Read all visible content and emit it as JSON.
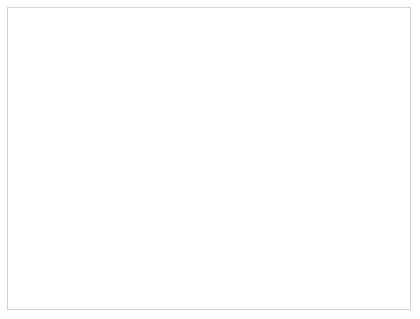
{
  "chart_data": {
    "type": "line",
    "title": "",
    "xlabel": "year",
    "ylabel": "annual discovery smoothed on 5 years & production Tcf/a",
    "ylabel_line1": "annual discovery smoothed on",
    "ylabel_line2": "5 years & production Tcf/a",
    "xlim": [
      1900,
      2000
    ],
    "ylim": [
      0,
      400
    ],
    "xticks": [
      1900,
      1910,
      1920,
      1930,
      1940,
      1950,
      1960,
      1970,
      1980,
      1990,
      2000
    ],
    "xtick_labels": [
      "1900",
      "1910",
      "1920",
      "1930",
      "1940",
      "1950",
      "1960",
      "1970",
      "1980",
      "1990",
      "2000"
    ],
    "yticks": [
      0,
      50,
      100,
      150,
      200,
      250,
      300,
      350,
      400
    ],
    "ytick_labels": [
      "0",
      "50",
      "100",
      "150",
      "200",
      "250",
      "300",
      "350",
      "400"
    ],
    "grid": true,
    "grid_color": "#d8d8d8",
    "legend_position": "inline-annotations",
    "line_color": "#111111",
    "series": [
      {
        "name": "discovery",
        "label": "discovery",
        "style": "solid-thin",
        "annotation_x": 1963,
        "annotation_y": 243,
        "bold": false,
        "x": [
          1900,
          1902,
          1905,
          1908,
          1910,
          1912,
          1914,
          1916,
          1918,
          1920,
          1922,
          1924,
          1925,
          1926,
          1927,
          1928,
          1929,
          1930,
          1931,
          1932,
          1933,
          1934,
          1935,
          1936,
          1937,
          1938,
          1939,
          1940,
          1941,
          1942,
          1943,
          1944,
          1945,
          1946,
          1947,
          1948,
          1949,
          1950,
          1951,
          1952,
          1953,
          1954,
          1955,
          1956,
          1957,
          1958,
          1959,
          1960,
          1961,
          1962,
          1963,
          1964,
          1965,
          1966,
          1967,
          1968,
          1969,
          1970,
          1971,
          1972,
          1973,
          1974,
          1975,
          1976,
          1977,
          1978,
          1979,
          1980,
          1981,
          1982,
          1983,
          1984,
          1985,
          1986,
          1987,
          1988,
          1989,
          1990,
          1991,
          1992,
          1993,
          1994,
          1995,
          1996,
          1997,
          1998,
          1999,
          2000
        ],
        "y": [
          2,
          2,
          3,
          3,
          4,
          5,
          6,
          7,
          8,
          9,
          11,
          12,
          14,
          29,
          26,
          22,
          17,
          14,
          13,
          13,
          13,
          16,
          27,
          39,
          49,
          56,
          53,
          43,
          36,
          35,
          35,
          30,
          24,
          47,
          62,
          72,
          80,
          83,
          78,
          62,
          55,
          55,
          57,
          70,
          100,
          140,
          152,
          148,
          133,
          132,
          180,
          272,
          278,
          290,
          305,
          287,
          318,
          360,
          400,
          378,
          372,
          372,
          200,
          165,
          155,
          130,
          120,
          118,
          105,
          98,
          88,
          80,
          73,
          70,
          82,
          80,
          78,
          75,
          72,
          68,
          57,
          63,
          72,
          78,
          85,
          84,
          84,
          85
        ]
      },
      {
        "name": "production",
        "label": "production",
        "style": "solid-thick",
        "annotation_x": 1981,
        "annotation_y": 28,
        "bold": true,
        "x": [
          1950,
          1952,
          1954,
          1956,
          1958,
          1960,
          1962,
          1964,
          1966,
          1968,
          1970,
          1972,
          1974,
          1976,
          1978,
          1980,
          1982,
          1984,
          1986,
          1988,
          1990,
          1992,
          1994,
          1996,
          1998,
          2000
        ],
        "y": [
          6,
          7,
          9,
          11,
          13,
          16,
          19,
          22,
          26,
          30,
          34,
          38,
          42,
          45,
          48,
          53,
          56,
          57,
          56,
          59,
          65,
          70,
          74,
          78,
          82,
          85
        ]
      },
      {
        "name": "production shifted back 40 years",
        "label": "production shifted\nback 40 years",
        "label_line1": "production shifted",
        "label_line2": "back 40 years",
        "style": "dashed",
        "annotation_x": 1913,
        "annotation_y": 82,
        "bold": true,
        "x": [
          1910,
          1912,
          1914,
          1916,
          1918,
          1920,
          1922,
          1924,
          1926,
          1928,
          1930,
          1932,
          1934,
          1936,
          1938,
          1940,
          1942,
          1944,
          1946,
          1948,
          1950,
          1952,
          1954,
          1956,
          1958,
          1960
        ],
        "y": [
          6,
          7,
          9,
          11,
          13,
          16,
          19,
          22,
          26,
          30,
          34,
          38,
          42,
          45,
          48,
          53,
          56,
          57,
          56,
          59,
          65,
          70,
          74,
          78,
          82,
          82
        ]
      }
    ]
  }
}
